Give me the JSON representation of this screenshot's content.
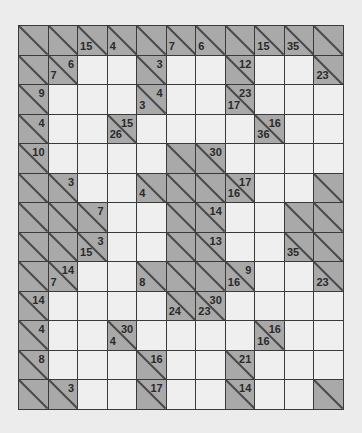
{
  "puzzle": {
    "type": "kakuro",
    "cols": 11,
    "rows": 13,
    "colors": {
      "background": "#ececec",
      "block": "#a9a9a9",
      "white": "#efefef",
      "grid_line": "#3a3a3a",
      "clue_text": "#2a2a2a"
    },
    "legend": "Each cell: 'W' = empty white entry cell; 'B' = block; block may have down (lower-left) and right (upper-right) sum clues",
    "grid": [
      [
        {
          "t": "B"
        },
        {
          "t": "B"
        },
        {
          "t": "B",
          "down": "15"
        },
        {
          "t": "B",
          "down": "4"
        },
        {
          "t": "B"
        },
        {
          "t": "B",
          "down": "7"
        },
        {
          "t": "B",
          "down": "6"
        },
        {
          "t": "B"
        },
        {
          "t": "B",
          "down": "15"
        },
        {
          "t": "B",
          "down": "35"
        },
        {
          "t": "B"
        }
      ],
      [
        {
          "t": "B"
        },
        {
          "t": "B",
          "down": "7",
          "right": "6"
        },
        {
          "t": "W"
        },
        {
          "t": "W"
        },
        {
          "t": "B",
          "right": "3"
        },
        {
          "t": "W"
        },
        {
          "t": "W"
        },
        {
          "t": "B",
          "right": "12"
        },
        {
          "t": "W"
        },
        {
          "t": "W"
        },
        {
          "t": "B",
          "down": "23"
        }
      ],
      [
        {
          "t": "B",
          "right": "9"
        },
        {
          "t": "W"
        },
        {
          "t": "W"
        },
        {
          "t": "W"
        },
        {
          "t": "B",
          "down": "3",
          "right": "4"
        },
        {
          "t": "W"
        },
        {
          "t": "W"
        },
        {
          "t": "B",
          "down": "17",
          "right": "23"
        },
        {
          "t": "W"
        },
        {
          "t": "W"
        },
        {
          "t": "W"
        }
      ],
      [
        {
          "t": "B",
          "right": "4"
        },
        {
          "t": "W"
        },
        {
          "t": "W"
        },
        {
          "t": "B",
          "down": "26",
          "right": "15"
        },
        {
          "t": "W"
        },
        {
          "t": "W"
        },
        {
          "t": "W"
        },
        {
          "t": "W"
        },
        {
          "t": "B",
          "down": "36",
          "right": "16"
        },
        {
          "t": "W"
        },
        {
          "t": "W"
        }
      ],
      [
        {
          "t": "B",
          "right": "10"
        },
        {
          "t": "W"
        },
        {
          "t": "W"
        },
        {
          "t": "W"
        },
        {
          "t": "W"
        },
        {
          "t": "B"
        },
        {
          "t": "B",
          "right": "30"
        },
        {
          "t": "W"
        },
        {
          "t": "W"
        },
        {
          "t": "W"
        },
        {
          "t": "W"
        }
      ],
      [
        {
          "t": "B"
        },
        {
          "t": "B",
          "right": "3"
        },
        {
          "t": "W"
        },
        {
          "t": "W"
        },
        {
          "t": "B",
          "down": "4"
        },
        {
          "t": "B"
        },
        {
          "t": "B"
        },
        {
          "t": "B",
          "down": "16",
          "right": "17"
        },
        {
          "t": "W"
        },
        {
          "t": "W"
        },
        {
          "t": "B"
        }
      ],
      [
        {
          "t": "B"
        },
        {
          "t": "B"
        },
        {
          "t": "B",
          "right": "7"
        },
        {
          "t": "W"
        },
        {
          "t": "W"
        },
        {
          "t": "B"
        },
        {
          "t": "B",
          "right": "14"
        },
        {
          "t": "W"
        },
        {
          "t": "W"
        },
        {
          "t": "B"
        },
        {
          "t": "B"
        }
      ],
      [
        {
          "t": "B"
        },
        {
          "t": "B"
        },
        {
          "t": "B",
          "down": "15",
          "right": "3"
        },
        {
          "t": "W"
        },
        {
          "t": "W"
        },
        {
          "t": "B"
        },
        {
          "t": "B",
          "right": "13"
        },
        {
          "t": "W"
        },
        {
          "t": "W"
        },
        {
          "t": "B",
          "down": "35"
        },
        {
          "t": "B"
        }
      ],
      [
        {
          "t": "B"
        },
        {
          "t": "B",
          "down": "7",
          "right": "14"
        },
        {
          "t": "W"
        },
        {
          "t": "W"
        },
        {
          "t": "B",
          "down": "8"
        },
        {
          "t": "B"
        },
        {
          "t": "B"
        },
        {
          "t": "B",
          "down": "16",
          "right": "9"
        },
        {
          "t": "W"
        },
        {
          "t": "W"
        },
        {
          "t": "B",
          "down": "23"
        }
      ],
      [
        {
          "t": "B",
          "right": "14"
        },
        {
          "t": "W"
        },
        {
          "t": "W"
        },
        {
          "t": "W"
        },
        {
          "t": "W"
        },
        {
          "t": "B",
          "down": "24"
        },
        {
          "t": "B",
          "down": "23",
          "right": "30"
        },
        {
          "t": "W"
        },
        {
          "t": "W"
        },
        {
          "t": "W"
        },
        {
          "t": "W"
        }
      ],
      [
        {
          "t": "B",
          "right": "4"
        },
        {
          "t": "W"
        },
        {
          "t": "W"
        },
        {
          "t": "B",
          "down": "4",
          "right": "30"
        },
        {
          "t": "W"
        },
        {
          "t": "W"
        },
        {
          "t": "W"
        },
        {
          "t": "W"
        },
        {
          "t": "B",
          "down": "16",
          "right": "16"
        },
        {
          "t": "W"
        },
        {
          "t": "W"
        }
      ],
      [
        {
          "t": "B",
          "right": "8"
        },
        {
          "t": "W"
        },
        {
          "t": "W"
        },
        {
          "t": "W"
        },
        {
          "t": "B",
          "right": "16"
        },
        {
          "t": "W"
        },
        {
          "t": "W"
        },
        {
          "t": "B",
          "right": "21"
        },
        {
          "t": "W"
        },
        {
          "t": "W"
        },
        {
          "t": "W"
        }
      ],
      [
        {
          "t": "B"
        },
        {
          "t": "B",
          "right": "3"
        },
        {
          "t": "W"
        },
        {
          "t": "W"
        },
        {
          "t": "B",
          "right": "17"
        },
        {
          "t": "W"
        },
        {
          "t": "W"
        },
        {
          "t": "B",
          "right": "14"
        },
        {
          "t": "W"
        },
        {
          "t": "W"
        },
        {
          "t": "B"
        }
      ]
    ]
  }
}
